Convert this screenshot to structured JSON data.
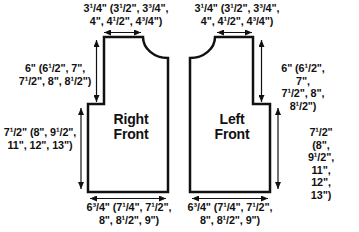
{
  "schematic": {
    "pieces": {
      "right": {
        "name": "Right Front",
        "label": "Right\nFront"
      },
      "left": {
        "name": "Left Front",
        "label": "Left\nFront"
      }
    },
    "measurements": {
      "shoulder_width": "3¹/4\" (3¹/2\", 3³/4\",\n4\", 4¹/2\", 4³/4\")",
      "armhole_depth": "6\" (6¹/2\", 7\",\n7¹/2\", 8\", 8¹/2\")",
      "body_length": "7¹/2\" (8\", 9¹/2\",\n11\", 12\", 13\")",
      "bottom_width": "6³/4\" (7¹/4\", 7¹/2\",\n8\", 8¹/2\", 9\")"
    },
    "colors": {
      "line": "#111111",
      "text": "#111111",
      "background": "#ffffff"
    }
  }
}
